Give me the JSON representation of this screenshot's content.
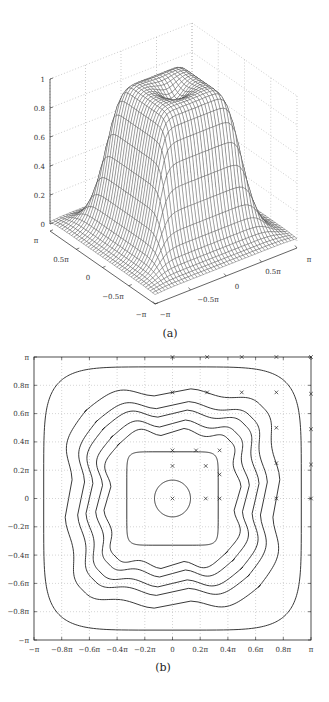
{
  "chart_data": [
    {
      "id": "a",
      "type": "surface",
      "caption": "(a)",
      "title": "",
      "description": "3D mesh surface of a smooth square plateau (height ~1) centred at origin, decaying to 0 near the domain edges, with a slight dip at the centre of the plateau",
      "x_range": [
        "-π",
        "π"
      ],
      "y_range": [
        "-π",
        "π"
      ],
      "zlim": [
        0,
        1
      ],
      "z_ticks": [
        "0",
        "0.2",
        "0.4",
        "0.6",
        "0.8",
        "1"
      ],
      "x_ticks": [
        "−π",
        "−0.5π",
        "0",
        "0.5π",
        "π"
      ],
      "y_ticks": [
        "π",
        "0.5π",
        "0",
        "−0.5π",
        "−π"
      ],
      "plateau_height": 1.0,
      "center_dip": 0.9,
      "grid": true
    },
    {
      "id": "b",
      "type": "contour",
      "caption": "(b)",
      "title": "",
      "xlabel": "",
      "ylabel": "",
      "xlim_pi": [
        -1,
        1
      ],
      "ylim_pi": [
        -1,
        1
      ],
      "x_ticks": [
        "−π",
        "−0.8π",
        "−0.6π",
        "−0.4π",
        "−0.2π",
        "0",
        "0.2π",
        "0.4π",
        "0.6π",
        "0.8π",
        "π"
      ],
      "y_ticks": [
        "π",
        "0.8π",
        "0.6π",
        "0.4π",
        "0.2π",
        "0",
        "−0.2π",
        "−0.4π",
        "−0.6π",
        "−0.8π",
        "−π"
      ],
      "grid": true,
      "contour_half_widths_pi": [
        0.93,
        0.75,
        0.66,
        0.6,
        0.53,
        0.47,
        0.33,
        0.13
      ],
      "markers": {
        "symbol": "x",
        "points_pi": [
          [
            0,
            1
          ],
          [
            0.25,
            1
          ],
          [
            0.5,
            1
          ],
          [
            0.75,
            1
          ],
          [
            1,
            1
          ],
          [
            0,
            0.75
          ],
          [
            0.25,
            0.75
          ],
          [
            0.5,
            0.75
          ],
          [
            0.75,
            0.75
          ],
          [
            1,
            0.74
          ],
          [
            0.75,
            0.5
          ],
          [
            1,
            0.49
          ],
          [
            0,
            0.34
          ],
          [
            0.17,
            0.34
          ],
          [
            0.34,
            0.34
          ],
          [
            0,
            0.23
          ],
          [
            0.24,
            0.23
          ],
          [
            0.75,
            0.25
          ],
          [
            1,
            0.24
          ],
          [
            0.34,
            0.17
          ],
          [
            0,
            0
          ],
          [
            0.24,
            0
          ],
          [
            0.34,
            0
          ],
          [
            0.75,
            0
          ],
          [
            1,
            0
          ]
        ]
      }
    }
  ]
}
